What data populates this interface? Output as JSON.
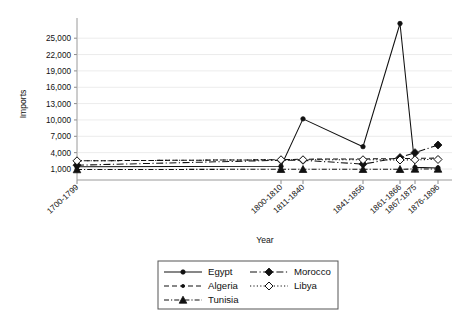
{
  "chart": {
    "type": "line",
    "title": "",
    "xlabel": "Year",
    "ylabel": "Imports"
  },
  "chart_data": {
    "type": "line",
    "title": "",
    "xlabel": "Year",
    "ylabel": "Imports",
    "categories": [
      "1700-1799",
      "1800-1810",
      "1811-1840",
      "1841-1856",
      "1861-1866",
      "1867-1875",
      "1876-1896"
    ],
    "ylim": [
      0,
      28500
    ],
    "yticks": [
      1000,
      4000,
      7000,
      10000,
      13000,
      16000,
      19000,
      22000,
      25000
    ],
    "ytick_labels": [
      "1,000",
      "4,000",
      "7,000",
      "10,000",
      "13,000",
      "16,000",
      "19,000",
      "22,000",
      "25,000"
    ],
    "grid": true,
    "legend_position": "bottom",
    "series": [
      {
        "name": "Egypt",
        "marker": "filled-circle",
        "dash": "solid",
        "values": [
          1400,
          1500,
          10200,
          5100,
          27700,
          1300,
          1200
        ]
      },
      {
        "name": "Morocco",
        "marker": "filled-diamond",
        "dash": "long-dash",
        "values": [
          1700,
          2600,
          2600,
          1900,
          3100,
          4000,
          5400
        ]
      },
      {
        "name": "Algeria",
        "marker": "small-circle",
        "dash": "dashed",
        "values": [
          2500,
          2700,
          2800,
          2850,
          2900,
          2950,
          3000
        ]
      },
      {
        "name": "Libya",
        "marker": "open-diamond",
        "dash": "dotted",
        "values": [
          2500,
          2700,
          2700,
          2700,
          2650,
          2700,
          2750
        ]
      },
      {
        "name": "Tunisia",
        "marker": "filled-triangle",
        "dash": "dash-dot",
        "values": [
          900,
          950,
          950,
          950,
          950,
          1000,
          1000
        ]
      }
    ],
    "legend_entries": [
      {
        "label": "Egypt",
        "marker": "filled-circle",
        "dash": "solid"
      },
      {
        "label": "Morocco",
        "marker": "filled-diamond",
        "dash": "long-dash"
      },
      {
        "label": "Algeria",
        "marker": "small-circle",
        "dash": "dashed"
      },
      {
        "label": "Libya",
        "marker": "open-diamond",
        "dash": "dotted"
      },
      {
        "label": "Tunisia",
        "marker": "filled-triangle",
        "dash": "dash-dot"
      }
    ]
  },
  "colors": {
    "line": "#111111",
    "grid": "#ececec",
    "axis": "#9a9a9a",
    "background": "#ffffff"
  }
}
